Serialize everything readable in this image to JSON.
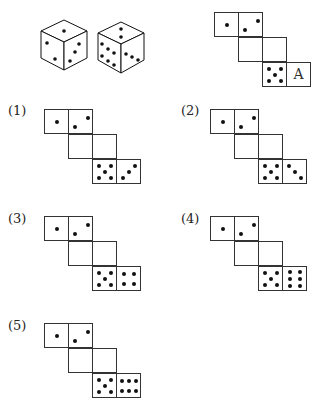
{
  "cubes": {
    "cube1": {
      "top": 1,
      "left": 3,
      "right": 3
    },
    "cube2": {
      "top": 2,
      "left": 6,
      "right": 3
    }
  },
  "reference_net": {
    "letter": "A"
  },
  "options": [
    {
      "label": "(1)",
      "last_face": 3
    },
    {
      "label": "(2)",
      "last_face": 3
    },
    {
      "label": "(3)",
      "last_face": 4
    },
    {
      "label": "(4)",
      "last_face": 6
    },
    {
      "label": "(5)",
      "last_face": 6
    }
  ]
}
